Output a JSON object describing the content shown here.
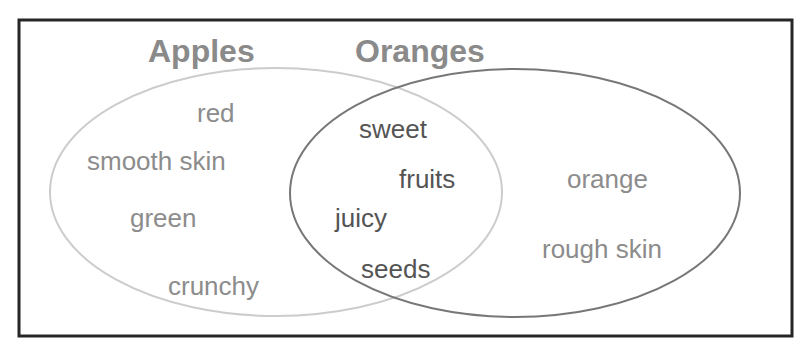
{
  "diagram": {
    "type": "venn",
    "frame": {
      "color": "#262626"
    },
    "sets": {
      "left": {
        "title": "Apples",
        "title_color": "#8a8a8a",
        "stroke_color": "#cccccc",
        "ellipse": {
          "cx": 276,
          "cy": 192,
          "rx": 226,
          "ry": 124
        },
        "title_pos": {
          "x": 148,
          "y": 62
        },
        "items": [
          {
            "label": "red",
            "x": 197,
            "y": 122
          },
          {
            "label": "smooth skin",
            "x": 87,
            "y": 170
          },
          {
            "label": "green",
            "x": 130,
            "y": 227
          },
          {
            "label": "crunchy",
            "x": 168,
            "y": 295
          }
        ],
        "item_color": "#8c8c8c"
      },
      "right": {
        "title": "Oranges",
        "title_color": "#8a8a8a",
        "stroke_color": "#777777",
        "ellipse": {
          "cx": 515,
          "cy": 193,
          "rx": 225,
          "ry": 124
        },
        "title_pos": {
          "x": 355,
          "y": 62
        },
        "items": [
          {
            "label": "orange",
            "x": 567,
            "y": 188
          },
          {
            "label": "rough skin",
            "x": 542,
            "y": 258
          }
        ],
        "item_color": "#8c8c8c"
      },
      "intersection": {
        "items": [
          {
            "label": "sweet",
            "x": 359,
            "y": 138
          },
          {
            "label": "fruits",
            "x": 399,
            "y": 188
          },
          {
            "label": "juicy",
            "x": 335,
            "y": 227
          },
          {
            "label": "seeds",
            "x": 361,
            "y": 278
          }
        ],
        "item_color": "#545454"
      }
    }
  }
}
